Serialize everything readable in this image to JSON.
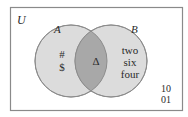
{
  "diagram": {
    "universe_label": "U",
    "set_a": {
      "label": "A",
      "elements_only": [
        "#",
        "$"
      ]
    },
    "set_b": {
      "label": "B",
      "elements_only": [
        "two",
        "six",
        "four"
      ]
    },
    "intersection": {
      "elements": [
        "Δ"
      ]
    },
    "outside": {
      "elements": [
        "10",
        "01"
      ]
    }
  },
  "colors": {
    "frame": "#8a8a8a",
    "circle_fill": "#dcdcdc",
    "circle_stroke": "#8c8c8c",
    "intersection_fill": "#a8a8a8",
    "text": "#2a2a2a"
  }
}
